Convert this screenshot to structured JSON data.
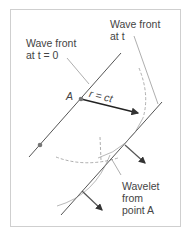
{
  "figure": {
    "labels": {
      "wavefront_t0_line1": "Wave front",
      "wavefront_t0_line2": "at t = 0",
      "wavefront_t_line1": "Wave front",
      "wavefront_t_line2": "at t",
      "point_a": "A",
      "radius": "r = ct",
      "wavelet_line1": "Wavelet",
      "wavelet_line2": "from",
      "wavelet_line3": "point A"
    },
    "colors": {
      "line": "#555555",
      "arrow": "#222222",
      "dashed": "#999999",
      "frame": "#cccccc",
      "point": "#777777"
    }
  }
}
